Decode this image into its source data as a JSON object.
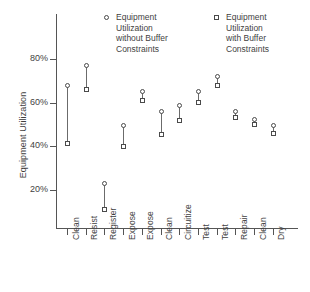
{
  "chart_data": {
    "type": "scatter",
    "title": "",
    "xlabel": "",
    "ylabel": "Equipment Utilization",
    "ylim": [
      0,
      90
    ],
    "yticks": [
      20,
      40,
      60,
      80
    ],
    "ytick_labels": [
      "20%",
      "40%",
      "60%",
      "80%"
    ],
    "grid": false,
    "legend_position": "top",
    "categories": [
      "Clean",
      "Resist",
      "Register",
      "Expose",
      "Expose",
      "Clean",
      "Circuitize",
      "Test",
      "Test",
      "Repair",
      "Clean",
      "Dry"
    ],
    "series": [
      {
        "name": "Equipment Utilization without Buffer Constraints",
        "marker": "circle",
        "values": [
          68,
          77,
          23,
          49.5,
          65,
          56,
          58.5,
          65,
          72,
          56,
          52.5,
          49.5
        ]
      },
      {
        "name": "Equipment Utilization with Buffer Constraints",
        "marker": "square",
        "values": [
          41.5,
          66,
          11,
          40,
          61,
          45.5,
          52,
          60,
          68,
          53,
          50,
          46
        ]
      }
    ]
  },
  "legend": {
    "without": {
      "marker": "circle",
      "lines": [
        "Equipment",
        "Utilization",
        "without Buffer",
        "Constraints"
      ]
    },
    "with": {
      "marker": "square",
      "lines": [
        "Equipment",
        "Utilization",
        "with Buffer",
        "Constraints"
      ]
    }
  }
}
